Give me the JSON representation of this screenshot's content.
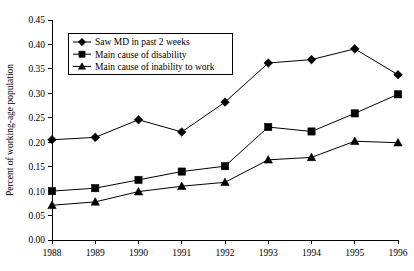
{
  "chart_data": {
    "type": "line",
    "title": "",
    "subtitle": "",
    "xlabel": "",
    "ylabel": "Percent of working-age population",
    "x": [
      1988,
      1989,
      1990,
      1991,
      1992,
      1993,
      1994,
      1995,
      1996
    ],
    "categories": [
      "1988",
      "1989",
      "1990",
      "1991",
      "1992",
      "1993",
      "1994",
      "1995",
      "1996"
    ],
    "xlim": [
      1988,
      1996
    ],
    "ylim": [
      0.0,
      0.45
    ],
    "ytick_values": [
      0.0,
      0.05,
      0.1,
      0.15,
      0.2,
      0.25,
      0.3,
      0.35,
      0.4,
      0.45
    ],
    "ytick_labels": [
      "0.00",
      "0.05",
      "0.10",
      "0.15",
      "0.20",
      "0.25",
      "0.30",
      "0.35",
      "0.40",
      "0.45"
    ],
    "xtick_labels": [
      "1988",
      "1989",
      "1990",
      "1991",
      "1992",
      "1993",
      "1994",
      "1995",
      "1996"
    ],
    "grid": false,
    "legend_position": "top-left-inside",
    "series": [
      {
        "name": "Saw MD in past 2 weeks",
        "marker": "diamond",
        "color": "#000000",
        "values": [
          0.205,
          0.21,
          0.246,
          0.221,
          0.282,
          0.362,
          0.369,
          0.391,
          0.338
        ]
      },
      {
        "name": "Main cause of disability",
        "marker": "square",
        "color": "#000000",
        "values": [
          0.1,
          0.106,
          0.123,
          0.14,
          0.151,
          0.231,
          0.222,
          0.259,
          0.298
        ]
      },
      {
        "name": "Main cause of inability to work",
        "marker": "triangle",
        "color": "#000000",
        "values": [
          0.071,
          0.078,
          0.099,
          0.11,
          0.118,
          0.164,
          0.169,
          0.202,
          0.199
        ]
      }
    ]
  }
}
